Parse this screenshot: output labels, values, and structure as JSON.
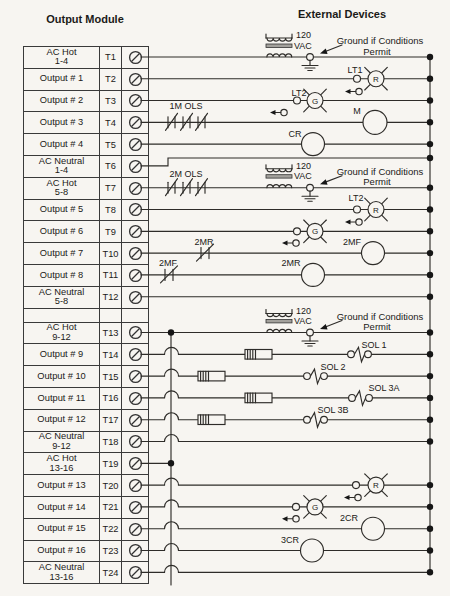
{
  "header": {
    "left_title": "Output Module",
    "right_title": "External Devices"
  },
  "terminals": [
    {
      "label": "AC Hot",
      "sub": "1-4",
      "id": "T1"
    },
    {
      "label": "Output # 1",
      "id": "T2"
    },
    {
      "label": "Output # 2",
      "id": "T3"
    },
    {
      "label": "Output # 3",
      "id": "T4"
    },
    {
      "label": "Output # 4",
      "id": "T5"
    },
    {
      "label": "AC Neutral",
      "sub": "1-4",
      "id": "T6"
    },
    {
      "label": "AC Hot",
      "sub": "5-8",
      "id": "T7"
    },
    {
      "label": "Output # 5",
      "id": "T8"
    },
    {
      "label": "Output # 6",
      "id": "T9"
    },
    {
      "label": "Output # 7",
      "id": "T10"
    },
    {
      "label": "Output # 8",
      "id": "T11"
    },
    {
      "label": "AC Neutral",
      "sub": "5-8",
      "id": "T12"
    },
    {
      "label": "AC Hot",
      "sub": "9-12",
      "id": "T13"
    },
    {
      "label": "Output # 9",
      "id": "T14"
    },
    {
      "label": "Output # 10",
      "id": "T15"
    },
    {
      "label": "Output # 11",
      "id": "T16"
    },
    {
      "label": "Output # 12",
      "id": "T17"
    },
    {
      "label": "AC Neutral",
      "sub": "9-12",
      "id": "T18"
    },
    {
      "label": "AC Hot",
      "sub": "13-16",
      "id": "T19"
    },
    {
      "label": "Output # 13",
      "id": "T20"
    },
    {
      "label": "Output # 14",
      "id": "T21"
    },
    {
      "label": "Output # 15",
      "id": "T22"
    },
    {
      "label": "Output # 16",
      "id": "T23"
    },
    {
      "label": "AC Neutral",
      "sub": "13-16",
      "id": "T24"
    }
  ],
  "diagram": {
    "voltage_line1": "120",
    "voltage_line2": "VAC",
    "ground_note_line1": "Ground if Conditions",
    "ground_note_line2": "Permit",
    "devices": {
      "lt1": "LT1",
      "lt2": "LT2",
      "lamp_red": "R",
      "lamp_green": "G",
      "ols1": "1M OLS",
      "ols2": "2M OLS",
      "motor_m": "M",
      "cr": "CR",
      "contact_2mr": "2MR",
      "coil_2mf": "2MF",
      "contact_2mf": "2MF",
      "coil_2mr": "2MR",
      "sol1": "SOL 1",
      "sol2": "SOL 2",
      "sol3a": "SOL 3A",
      "sol3b": "SOL 3B",
      "coil_2cr": "2CR",
      "coil_3cr": "3CR"
    }
  }
}
